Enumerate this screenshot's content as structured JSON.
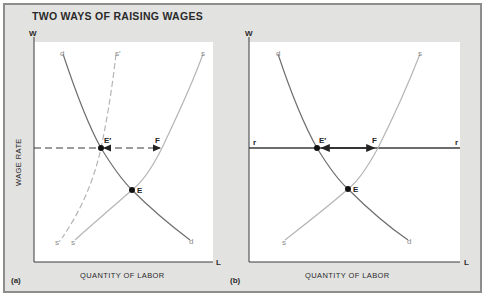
{
  "title": "TWO WAYS OF RAISING WAGES",
  "colors": {
    "frame_bg": "#e2e2e1",
    "frame_border": "#8d8d8b",
    "plot_bg": "#ffffff",
    "axis": "#3a3a3a",
    "demand_curve": "#6f6f6f",
    "supply_curve": "#b5b5b5",
    "wage_line": "#3a3a3a",
    "point": "#111111"
  },
  "panels": [
    {
      "id": "a",
      "label": "(a)",
      "y_axis_letter": "W",
      "x_axis_letter": "L",
      "y_axis_title": "WAGE RATE",
      "x_axis_title": "QUANTITY OF LABOR",
      "curves": {
        "demand": {
          "label_top": "d",
          "label_bottom": "d"
        },
        "supply": {
          "label_top": "s",
          "label_bottom": "s"
        },
        "supply_shifted": {
          "label_top": "s′",
          "label_bottom": "s′",
          "style": "dashed"
        }
      },
      "points": {
        "equilibrium": "E",
        "new_equilibrium": "E′",
        "supply_at_wage": "F"
      },
      "wage_line": {
        "style": "dashed"
      }
    },
    {
      "id": "b",
      "label": "(b)",
      "y_axis_letter": "W",
      "x_axis_letter": "L",
      "x_axis_title": "QUANTITY OF LABOR",
      "curves": {
        "demand": {
          "label_top": "d",
          "label_bottom": "d"
        },
        "supply": {
          "label_top": "s",
          "label_bottom": "s"
        }
      },
      "points": {
        "equilibrium": "E",
        "new_equilibrium": "E′",
        "supply_at_wage": "F"
      },
      "wage_line": {
        "style": "solid",
        "label_left": "r",
        "label_right": "r"
      }
    }
  ]
}
